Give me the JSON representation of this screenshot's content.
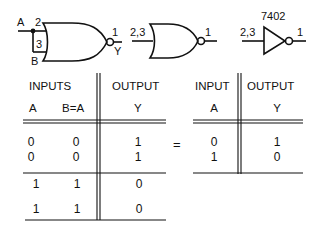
{
  "gates": {
    "gate1": {
      "input_a": "A",
      "input_b": "B",
      "pin_a": "2",
      "pin_b": "3",
      "pin_out": "1",
      "output": "Y"
    },
    "gate2": {
      "pins_in": "2,3",
      "pin_out": "1"
    },
    "gate3": {
      "part": "7402",
      "pins_in": "2,3",
      "pin_out": "1"
    }
  },
  "table_left": {
    "group_inputs": "INPUTS",
    "group_output": "OUTPUT",
    "col_a": "A",
    "col_b": "B=A",
    "col_y": "Y",
    "rows": [
      {
        "a": "0",
        "b": "0",
        "y": "1"
      },
      {
        "a": "0",
        "b": "0",
        "y": "1"
      },
      {
        "a": "1",
        "b": "1",
        "y": "0"
      },
      {
        "a": "1",
        "b": "1",
        "y": "0"
      }
    ]
  },
  "equals": "=",
  "table_right": {
    "group_input": "INPUT",
    "group_output": "OUTPUT",
    "col_a": "A",
    "col_y": "Y",
    "rows": [
      {
        "a": "0",
        "y": "1"
      },
      {
        "a": "1",
        "y": "0"
      }
    ]
  }
}
